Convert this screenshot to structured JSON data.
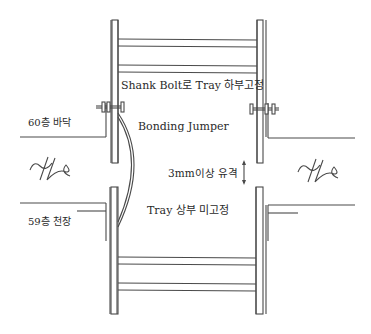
{
  "diagram": {
    "type": "cable-tray-floor-penetration-detail",
    "labels": {
      "top_fixing": "Shank Bolt로 Tray 하부고정",
      "floor_60": "60층 바닥",
      "bonding_jumper": "Bonding Jumper",
      "gap": "3mm이상 유격",
      "floor_59": "59층 천장",
      "bottom_unfixed": "Tray 상부 미고정"
    },
    "symbols": {
      "slab_break_left": "slab-break-symbol",
      "slab_break_right": "slab-break-symbol",
      "gap_arrow": "double-headed-arrow",
      "bolts": "shank-bolt"
    },
    "colors": {
      "line": "#4a4a4a",
      "background": "#ffffff"
    }
  }
}
